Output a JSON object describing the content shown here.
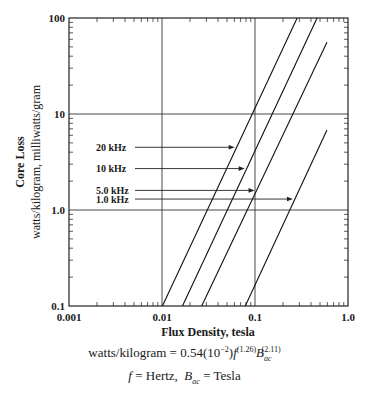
{
  "chart_data": {
    "type": "line",
    "title": "",
    "xlabel": "Flux Density, tesla",
    "ylabel": "Core Loss",
    "ylabel_sub": "watts/kilogram, milliwatts/gram",
    "xscale": "log",
    "yscale": "log",
    "xlim": [
      0.001,
      1.0
    ],
    "ylim": [
      0.1,
      100
    ],
    "x_ticks": [
      "0.001",
      "0.01",
      "0.1",
      "1.0"
    ],
    "y_ticks": [
      "0.1",
      "1.0",
      "10",
      "100"
    ],
    "grid": "major decades",
    "series": [
      {
        "name": "20 kHz",
        "x": [
          0.0101,
          0.284
        ],
        "y": [
          0.1,
          100
        ],
        "arrow_y": 4.5
      },
      {
        "name": "10 kHz",
        "x": [
          0.0166,
          0.465
        ],
        "y": [
          0.1,
          100
        ],
        "arrow_y": 2.7
      },
      {
        "name": "5.0 kHz",
        "x": [
          0.0267,
          0.594
        ],
        "y": [
          0.1,
          56
        ],
        "arrow_y": 1.6
      },
      {
        "name": "1.0 kHz",
        "x": [
          0.0786,
          0.594
        ],
        "y": [
          0.1,
          6.8
        ],
        "arrow_y": 1.3
      }
    ],
    "annotations": {
      "formula_lhs": "watts/kilogram = 0.54",
      "formula_coef_exp": "−2",
      "formula_f_exp": "(1.26)",
      "formula_b_exp": "(2.11)",
      "legend_f": "f",
      "legend_f_def": " = Hertz,",
      "legend_b": "B",
      "legend_b_sub": "ac",
      "legend_b_def": " = Tesla"
    }
  }
}
